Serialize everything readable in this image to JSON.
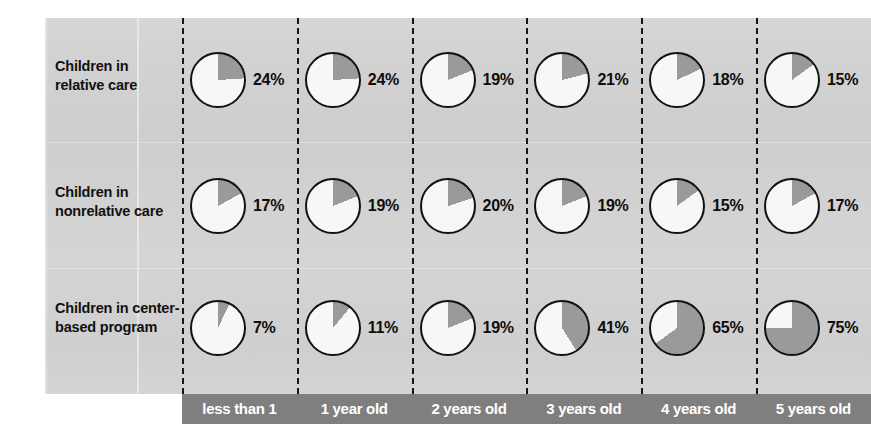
{
  "axis": {
    "y_title": "Percentage of Children in Each Age Group*"
  },
  "chart_data": {
    "type": "pie",
    "title": "",
    "subtitle": "",
    "xlabel": "",
    "ylabel": "Percentage of Children in Each Age Group*",
    "grid": false,
    "legend_position": "none",
    "note": "Grid of small pie charts. Each pie shows the shaded (gray) share equal to the labeled percentage, drawn clockwise from 12 o'clock; the remainder is white.",
    "colors": {
      "panel_background": "#d2d2d2",
      "axis_bar_background": "#7f7f7f",
      "pie_shaded": "#9a9a9a",
      "pie_unshaded": "#f7f7f7",
      "pie_outline": "#111111",
      "text": "#111111",
      "axis_bar_text": "#ffffff",
      "divider": "#151515"
    },
    "categories": [
      "less than 1",
      "1 year old",
      "2 years old",
      "3 years old",
      "4 years old",
      "5 years old"
    ],
    "series": [
      {
        "name": "Children in relative care",
        "values": [
          24,
          24,
          19,
          21,
          18,
          15
        ],
        "labels": [
          "24%",
          "24%",
          "19%",
          "21%",
          "18%",
          "15%"
        ]
      },
      {
        "name": "Children in nonrelative care",
        "values": [
          17,
          19,
          20,
          19,
          15,
          17
        ],
        "labels": [
          "17%",
          "19%",
          "20%",
          "19%",
          "15%",
          "17%"
        ]
      },
      {
        "name": "Children in center-based program",
        "values": [
          7,
          11,
          19,
          41,
          65,
          75
        ],
        "labels": [
          "7%",
          "11%",
          "19%",
          "41%",
          "65%",
          "75%"
        ]
      }
    ]
  }
}
